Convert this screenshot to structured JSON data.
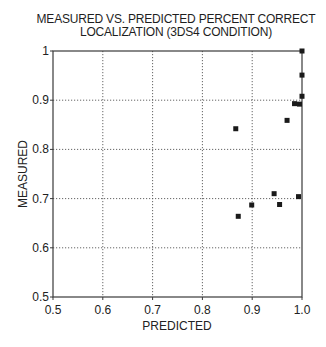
{
  "chart_data": {
    "type": "scatter",
    "title_lines": [
      "MEASURED VS. PREDICTED PERCENT CORRECT",
      "LOCALIZATION (3DS4 CONDITION)"
    ],
    "xlabel": "PREDICTED",
    "ylabel": "MEASURED",
    "xlim": [
      0.5,
      1.0
    ],
    "ylim": [
      0.5,
      1.0
    ],
    "x_ticks": [
      "0.5",
      "0.6",
      "0.7",
      "0.8",
      "0.9",
      "1.0"
    ],
    "y_ticks": [
      "0.5",
      "0.6",
      "0.7",
      "0.8",
      "0.9",
      "1"
    ],
    "grid": true,
    "grid_style": "dotted",
    "marker": "square",
    "legend": null,
    "points": [
      {
        "x": 1.0,
        "y": 1.0
      },
      {
        "x": 1.0,
        "y": 0.951
      },
      {
        "x": 1.0,
        "y": 0.908
      },
      {
        "x": 0.985,
        "y": 0.893
      },
      {
        "x": 0.995,
        "y": 0.892
      },
      {
        "x": 0.97,
        "y": 0.859
      },
      {
        "x": 0.867,
        "y": 0.842
      },
      {
        "x": 0.944,
        "y": 0.71
      },
      {
        "x": 0.993,
        "y": 0.704
      },
      {
        "x": 0.955,
        "y": 0.688
      },
      {
        "x": 0.899,
        "y": 0.687
      },
      {
        "x": 0.872,
        "y": 0.664
      }
    ]
  },
  "colors": {
    "axis": "#3a3a3a",
    "grid": "#555555",
    "marker": "#1a1a1a",
    "text": "#222222"
  }
}
